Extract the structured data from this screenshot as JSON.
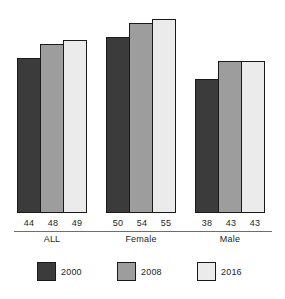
{
  "chart_data": {
    "type": "bar",
    "title": "",
    "subtitle": "",
    "xlabel": "",
    "ylabel": "",
    "grid": false,
    "legend_position": "bottom",
    "ylim": [
      0,
      55
    ],
    "categories": [
      "ALL",
      "Female",
      "Male"
    ],
    "series": [
      {
        "name": "2000",
        "color": "#3b3b3b",
        "values": [
          44,
          50,
          38
        ]
      },
      {
        "name": "2008",
        "color": "#9d9d9d",
        "values": [
          48,
          54,
          43
        ]
      },
      {
        "name": "2016",
        "color": "#ebebeb",
        "values": [
          49,
          55,
          43
        ]
      }
    ],
    "value_labels": {
      "ALL": [
        "44",
        "48",
        "49"
      ],
      "Female": [
        "50",
        "54",
        "55"
      ],
      "Male": [
        "38",
        "43",
        "43"
      ]
    }
  },
  "axis": {
    "line_color": "#6d6e71"
  },
  "groups": [
    {
      "name": "ALL",
      "label": "ALL",
      "bars": [
        {
          "series": "2000",
          "value": 44,
          "label": "44",
          "color": "#3b3b3b"
        },
        {
          "series": "2008",
          "value": 48,
          "label": "48",
          "color": "#9d9d9d"
        },
        {
          "series": "2016",
          "value": 49,
          "label": "49",
          "color": "#ebebeb"
        }
      ]
    },
    {
      "name": "Female",
      "label": "Female",
      "bars": [
        {
          "series": "2000",
          "value": 50,
          "label": "50",
          "color": "#3b3b3b"
        },
        {
          "series": "2008",
          "value": 54,
          "label": "54",
          "color": "#9d9d9d"
        },
        {
          "series": "2016",
          "value": 55,
          "label": "55",
          "color": "#ebebeb"
        }
      ]
    },
    {
      "name": "Male",
      "label": "Male",
      "bars": [
        {
          "series": "2000",
          "value": 38,
          "label": "38",
          "color": "#3b3b3b"
        },
        {
          "series": "2008",
          "value": 43,
          "label": "43",
          "color": "#9d9d9d"
        },
        {
          "series": "2016",
          "value": 43,
          "label": "43",
          "color": "#ebebeb"
        }
      ]
    }
  ],
  "legend": {
    "items": [
      {
        "label": "2000",
        "color": "#3b3b3b"
      },
      {
        "label": "2008",
        "color": "#9d9d9d"
      },
      {
        "label": "2016",
        "color": "#ebebeb"
      }
    ]
  }
}
